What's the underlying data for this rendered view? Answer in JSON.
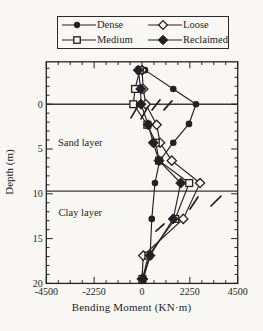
{
  "figure": {
    "colors": {
      "ink": "#222222",
      "paper": "#f8f7f3",
      "boundary_line": "#3a3a3a"
    }
  },
  "legend": {
    "items": [
      {
        "label": "Dense",
        "marker": "circle-filled"
      },
      {
        "label": "Loose",
        "marker": "diamond-open"
      },
      {
        "label": "Medium",
        "marker": "square-open"
      },
      {
        "label": "Reclaimed",
        "marker": "diamond-filled"
      }
    ]
  },
  "chart_data": {
    "type": "line",
    "title": "",
    "xlabel": "Bending Moment (KN·m)",
    "ylabel": "Depth (m)",
    "xlim": [
      -4500,
      4500
    ],
    "depth_range": [
      -4.73,
      20
    ],
    "x_ticks": [
      -4500,
      -2250,
      0,
      2250,
      4500
    ],
    "x_tick_labels": [
      "-4500",
      "-2250",
      "0",
      "2250",
      "4500"
    ],
    "y_ticks": [
      0,
      5,
      10,
      15,
      20
    ],
    "y_tick_labels": [
      "0",
      "5",
      "10",
      "15",
      "20"
    ],
    "x_minor_step": 562.5,
    "y_minor_step": 1,
    "grid": false,
    "legend_position": "top-outside",
    "layer_boundaries_depth": [
      0,
      9.7
    ],
    "region_labels": [
      {
        "text": "Sand layer",
        "x": -2900,
        "depth": 4.25
      },
      {
        "text": "Clay layer",
        "x": -2900,
        "depth": 12.1
      }
    ],
    "series": [
      {
        "name": "Dense",
        "marker": "circle-filled",
        "points": [
          [
            140,
            -3.8
          ],
          [
            1470,
            -1.7
          ],
          [
            2540,
            0
          ],
          [
            2210,
            2.2
          ],
          [
            1470,
            4.3
          ],
          [
            830,
            6.3
          ],
          [
            610,
            8.8
          ],
          [
            460,
            12.8
          ],
          [
            380,
            16.9
          ],
          [
            60,
            19.5
          ]
        ]
      },
      {
        "name": "Loose",
        "marker": "diamond-open",
        "points": [
          [
            0,
            -3.8
          ],
          [
            60,
            -1.7
          ],
          [
            175,
            0
          ],
          [
            690,
            2.3
          ],
          [
            850,
            4.3
          ],
          [
            1400,
            6.3
          ],
          [
            2730,
            8.8
          ],
          [
            1940,
            12.8
          ],
          [
            60,
            16.9
          ],
          [
            0,
            19.5
          ]
        ]
      },
      {
        "name": "Medium",
        "marker": "square-open",
        "points": [
          [
            -100,
            -3.8
          ],
          [
            -330,
            -1.7
          ],
          [
            -410,
            0
          ],
          [
            250,
            2.3
          ],
          [
            650,
            4.3
          ],
          [
            800,
            6.3
          ],
          [
            2220,
            8.8
          ],
          [
            1560,
            12.8
          ],
          [
            300,
            16.9
          ],
          [
            20,
            19.5
          ]
        ]
      },
      {
        "name": "Reclaimed",
        "marker": "diamond-filled",
        "points": [
          [
            -175,
            -3.8
          ],
          [
            -60,
            -1.7
          ],
          [
            -50,
            0
          ],
          [
            295,
            2.3
          ],
          [
            530,
            4.3
          ],
          [
            800,
            6.3
          ],
          [
            1820,
            8.8
          ],
          [
            1470,
            12.8
          ],
          [
            375,
            16.9
          ],
          [
            40,
            19.5
          ]
        ]
      }
    ],
    "slash_marks": [
      [
        -517,
        1.53,
        -188,
        0.19
      ],
      [
        -47,
        1.64,
        329,
        0.08
      ],
      [
        470,
        0.64,
        846,
        -0.48
      ],
      [
        1034,
        0.64,
        1410,
        -0.37
      ],
      [
        2257,
        11.7,
        2633,
        10.36
      ],
      [
        3244,
        11.36,
        3714,
        10.25
      ],
      [
        658,
        14.16,
        1034,
        13.37
      ]
    ]
  }
}
